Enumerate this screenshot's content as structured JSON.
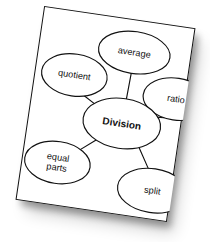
{
  "document": {
    "kind": "concept-map",
    "surface": "white paper card",
    "rotation_degrees": 8.4,
    "background_color": "#ffffff",
    "card_color": "#ffffff",
    "ink_color": "#111111",
    "has_drop_shadow": true
  },
  "diagram": {
    "type": "concept-map",
    "center": {
      "id": "division",
      "label": "Division",
      "bold": true,
      "shape": "ellipse",
      "cx": 93,
      "cy": 104,
      "rx": 39,
      "ry": 25
    },
    "nodes": [
      {
        "id": "average",
        "label": "average",
        "lines": [
          "average"
        ],
        "shape": "ellipse",
        "cx": 95,
        "cy": 32,
        "rx": 36,
        "ry": 21
      },
      {
        "id": "quotient",
        "label": "quotient",
        "lines": [
          "quotient"
        ],
        "shape": "ellipse",
        "cx": 39,
        "cy": 63,
        "rx": 33,
        "ry": 21
      },
      {
        "id": "ratio",
        "label": "ratio",
        "lines": [
          "ratio"
        ],
        "shape": "ellipse",
        "cx": 143,
        "cy": 72,
        "rx": 33,
        "ry": 21
      },
      {
        "id": "equal-parts",
        "label": "equal parts",
        "lines": [
          "equal",
          "parts"
        ],
        "shape": "ellipse",
        "cx": 35,
        "cy": 152,
        "rx": 33,
        "ry": 21
      },
      {
        "id": "split",
        "label": "split",
        "lines": [
          "split"
        ],
        "shape": "ellipse",
        "cx": 133,
        "cy": 166,
        "rx": 35,
        "ry": 22
      }
    ],
    "edges": [
      {
        "id": "edge-division-average",
        "from": "division",
        "to": "average",
        "x1": 94,
        "y1": 79,
        "x2": 95,
        "y2": 53
      },
      {
        "id": "edge-division-quotient",
        "from": "division",
        "to": "quotient",
        "x1": 64,
        "y1": 89,
        "x2": 50,
        "y2": 81
      },
      {
        "id": "edge-division-ratio",
        "from": "division",
        "to": "ratio",
        "x1": 122,
        "y1": 93,
        "x2": 134,
        "y2": 92
      },
      {
        "id": "edge-division-equal-parts",
        "from": "division",
        "to": "equal-parts",
        "x1": 70,
        "y1": 124,
        "x2": 52,
        "y2": 139
      },
      {
        "id": "edge-division-split",
        "from": "division",
        "to": "split",
        "x1": 114,
        "y1": 126,
        "x2": 126,
        "y2": 145
      }
    ]
  }
}
